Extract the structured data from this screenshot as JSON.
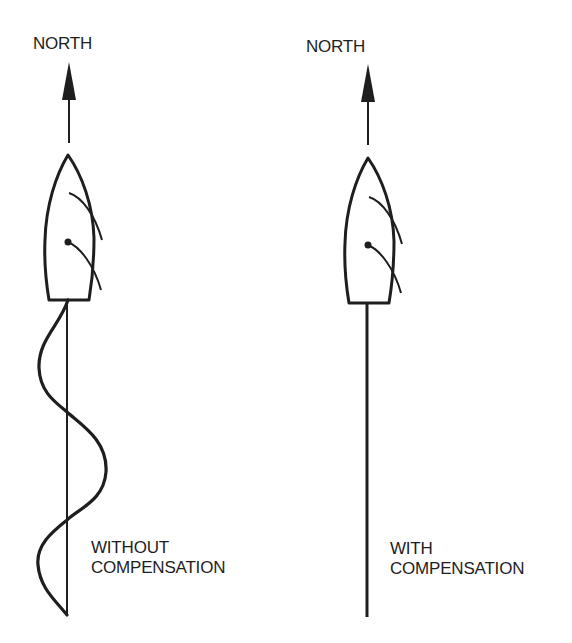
{
  "diagram": {
    "colors": {
      "ink": "#1e1e1e",
      "background": "#ffffff"
    },
    "panels": [
      {
        "id": "without",
        "north_label": "NORTH",
        "caption_line1": "WITHOUT",
        "caption_line2": "COMPENSATION",
        "track": "sinusoidal wake oscillating around the straight course line"
      },
      {
        "id": "with",
        "north_label": "NORTH",
        "caption_line1": "WITH",
        "caption_line2": "COMPENSATION",
        "track": "straight wake along the course line"
      }
    ]
  }
}
